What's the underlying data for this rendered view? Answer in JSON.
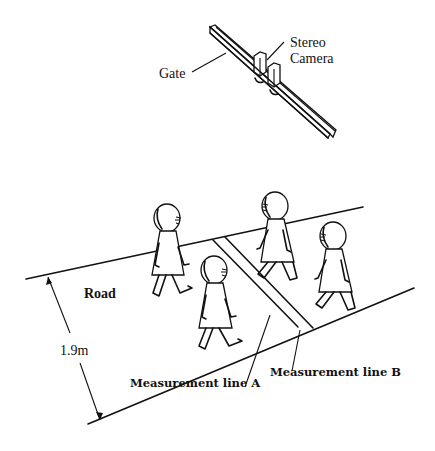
{
  "figure": {
    "labels": {
      "gate": "Gate",
      "camera_line1": "Stereo",
      "camera_line2": "Camera",
      "road": "Road",
      "width": "1.9m",
      "line_a": "Measurement line A",
      "line_b": "Measurement line B"
    },
    "road_width_m": 1.9,
    "pedestrian_count": 4,
    "colors": {
      "ink": "#111111",
      "background": "#ffffff"
    }
  }
}
